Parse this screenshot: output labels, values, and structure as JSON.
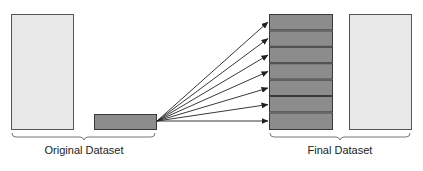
{
  "diagram": {
    "labels": {
      "original": "Original Dataset",
      "final": "Final Dataset"
    },
    "colors": {
      "light_fill": "#e8e8e8",
      "dark_fill": "#8c8c8c",
      "stroke": "#3a3a3a",
      "arrow": "#222222"
    },
    "final_segments": 7,
    "arrow_count": 7
  }
}
